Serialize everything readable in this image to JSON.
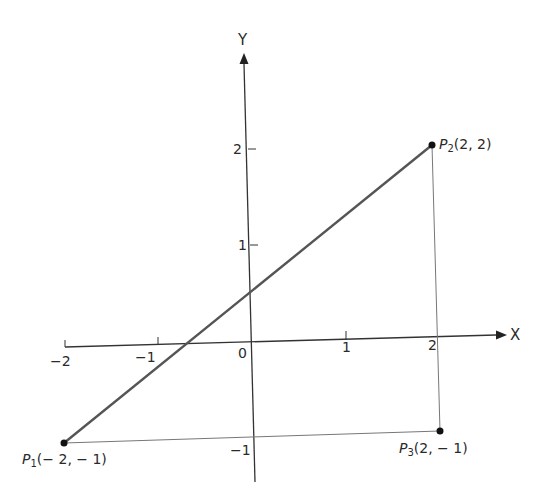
{
  "axes": {
    "x_label": "X",
    "y_label": "Y",
    "x_ticks": [
      "−2",
      "−1",
      "0",
      "1",
      "2"
    ],
    "y_ticks": [
      "2",
      "1",
      "−1"
    ]
  },
  "points": [
    {
      "name": "P",
      "sub": "1",
      "coords": "(− 2, − 1)",
      "x": -2,
      "y": -1
    },
    {
      "name": "P",
      "sub": "2",
      "coords": "(2, 2)",
      "x": 2,
      "y": 2
    },
    {
      "name": "P",
      "sub": "3",
      "coords": "(2, − 1)",
      "x": 2,
      "y": -1
    }
  ],
  "segments": [
    {
      "from": "P1",
      "to": "P2",
      "style": "thick"
    },
    {
      "from": "P2",
      "to": "P3",
      "style": "thin"
    },
    {
      "from": "P1",
      "to": "P3",
      "style": "thin"
    }
  ],
  "colors": {
    "axis": "#333333",
    "main_line": "#555555",
    "thin_line": "#777777",
    "point": "#111111"
  }
}
